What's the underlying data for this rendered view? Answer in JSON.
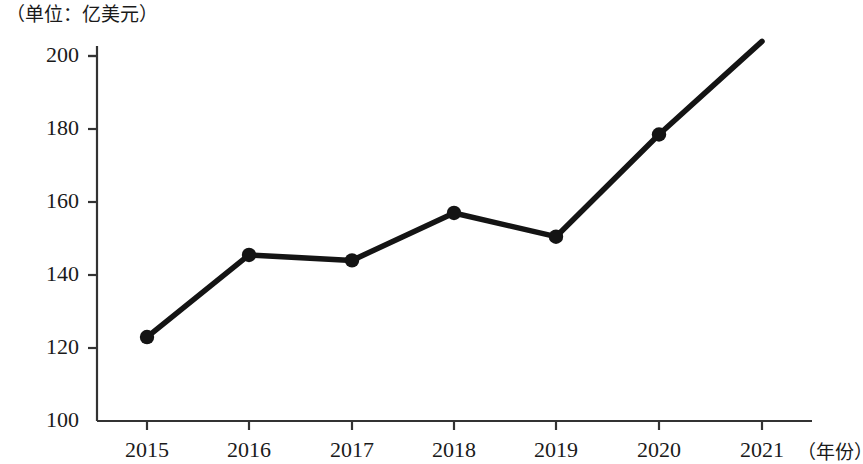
{
  "chart_data": {
    "type": "line",
    "title": "",
    "unit_label": "（单位：亿美元）",
    "xlabel": "（年份）",
    "ylabel": "",
    "categories": [
      "2015",
      "2016",
      "2017",
      "2018",
      "2019",
      "2020",
      "2021"
    ],
    "values": [
      123,
      145.5,
      144,
      157,
      150.5,
      178.5,
      204
    ],
    "series": [
      {
        "name": "",
        "values": [
          123,
          145.5,
          144,
          157,
          150.5,
          178.5,
          204
        ]
      }
    ],
    "ylim": [
      100,
      200
    ],
    "yticks": [
      "100",
      "120",
      "140",
      "160",
      "180",
      "200"
    ],
    "ytick_values": [
      100,
      120,
      140,
      160,
      180,
      200
    ],
    "xticks": [
      "2015",
      "2016",
      "2017",
      "2018",
      "2019",
      "2020",
      "2021"
    ],
    "grid": false,
    "legend": "none",
    "line_color": "#141414",
    "marker_color": "#141414",
    "axis_color": "#333333",
    "markers_shown": [
      true,
      true,
      true,
      true,
      true,
      true,
      false
    ],
    "axis_clipped_top": true
  },
  "geometry": {
    "plot_left": 97,
    "plot_right": 812,
    "baseline_y": 421,
    "top_y": 56,
    "x_positions": [
      147,
      249,
      352,
      454,
      556,
      659,
      762
    ],
    "y_per_unit": 3.65
  }
}
